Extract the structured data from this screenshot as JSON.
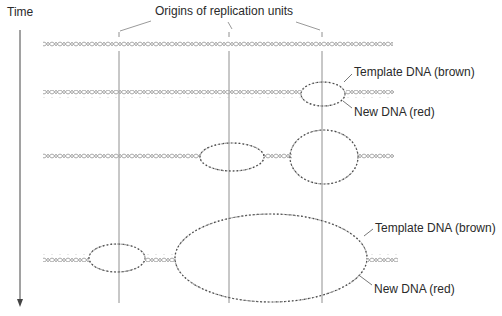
{
  "figure": {
    "time_label": "Time",
    "origins_label": "Origins of replication units",
    "annotations": [
      {
        "id": "template-top",
        "text": "Template DNA (brown)"
      },
      {
        "id": "new-top",
        "text": "New DNA (red)"
      },
      {
        "id": "template-bottom",
        "text": "Template DNA (brown)"
      },
      {
        "id": "new-bottom",
        "text": "New DNA (red)"
      }
    ],
    "colors": {
      "template_dna": "#a0a0a0",
      "new_dna": "#505050",
      "lines": "#808080",
      "text": "#2a2a2a"
    },
    "rows": [
      {
        "stage": 1,
        "bubbles": []
      },
      {
        "stage": 2,
        "bubbles": [
          "origin-3"
        ]
      },
      {
        "stage": 3,
        "bubbles": [
          "origin-2",
          "origin-3"
        ]
      },
      {
        "stage": 4,
        "bubbles": [
          "origin-1",
          "origin-2+3-merged"
        ]
      }
    ]
  }
}
